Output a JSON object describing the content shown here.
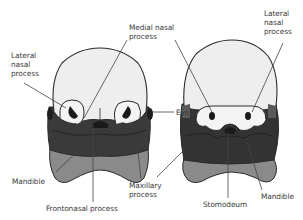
{
  "diagram": {
    "colors": {
      "head": "#eeeeee",
      "outline": "#2a2a2a",
      "maxillary": "#383838",
      "mandible_left": "#555555",
      "mandible_lower": "#8a8a8a",
      "nostril": "#1a1a1a",
      "leader_line": "#444444",
      "text": "#3a3a3a"
    },
    "figures": [
      {
        "id": "left-embryo",
        "labels": {
          "lateral_nasal": "Lateral\nnasal\nprocess",
          "mandible": "Mandible",
          "frontonasal": "Frontonasal process",
          "maxillary": "Maxillary\nprocess"
        }
      },
      {
        "id": "right-embryo",
        "labels": {
          "medial_nasal": "Medial nasal\nprocess",
          "lateral_nasal": "Lateral\nnasal\nprocess",
          "eye": "Eye",
          "stomodeum": "Stomodeum",
          "mandible": "Mandible"
        }
      }
    ]
  }
}
